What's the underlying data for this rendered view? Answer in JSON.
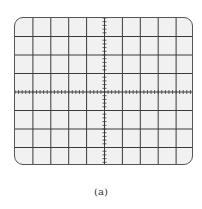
{
  "figure": {
    "caption": "(a)",
    "type": "oscilloscope-graticule",
    "grid": {
      "horizontal_divisions": 10,
      "vertical_divisions": 8,
      "minor_ticks_per_division": 5
    },
    "colors": {
      "screen_background": "#f1f1f1",
      "grid_line": "#3a3a3a",
      "page_background": "#ffffff"
    }
  }
}
